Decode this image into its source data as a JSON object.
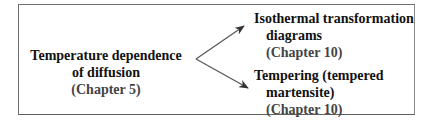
{
  "source_node": {
    "line1": "Temperature dependence",
    "line2": "of diffusion",
    "chapter": "(Chapter 5)"
  },
  "targets": [
    {
      "line1": "Isothermal transformation",
      "line2": "diagrams",
      "chapter": "(Chapter 10)"
    },
    {
      "line1": "Tempering (tempered",
      "line2": "martensite)",
      "chapter": "(Chapter 10)"
    }
  ],
  "colors": {
    "text": "#111111",
    "chapter_text": "#444444",
    "border": "#6e6e6e",
    "arrow": "#333333"
  }
}
